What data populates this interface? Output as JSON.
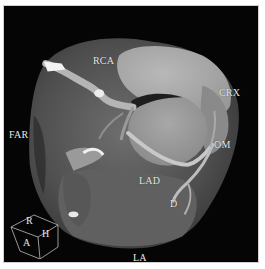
{
  "image": {
    "description": "Cardiac CT volume rendering with annotated coronary arteries",
    "background_color": "#050505",
    "border_color": "#ffffff"
  },
  "labels": {
    "rca": "RCA",
    "crx": "CRX",
    "om": "OM",
    "lad": "LAD",
    "d": "D",
    "far": "FAR",
    "la": "LA"
  },
  "orientation_cube": {
    "top": "R",
    "left": "A",
    "right": "H"
  }
}
